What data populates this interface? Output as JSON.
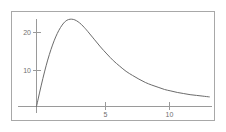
{
  "figure": {
    "background_color": "#ffffff",
    "frame_color": "#a8a8a8",
    "axis_color": "#9a9a9a",
    "curve_color": "#6b6b6b",
    "label_color": "#6f6f6f"
  },
  "chart_data": {
    "type": "line",
    "title": "",
    "xlabel": "",
    "ylabel": "",
    "xlim": [
      -0.4,
      13.6
    ],
    "ylim": [
      -1.2,
      26.5
    ],
    "grid": false,
    "legend": null,
    "x_ticks": [
      5,
      10
    ],
    "x_tick_labels": [
      "5",
      "10"
    ],
    "y_ticks": [
      10,
      20
    ],
    "y_tick_labels": [
      "10",
      "20"
    ],
    "series": [
      {
        "name": "density",
        "x": [
          0.0,
          0.25,
          0.5,
          0.75,
          1.0,
          1.25,
          1.5,
          1.75,
          2.0,
          2.25,
          2.5,
          2.75,
          3.0,
          3.25,
          3.5,
          3.75,
          4.0,
          4.5,
          5.0,
          5.5,
          6.0,
          6.5,
          7.0,
          7.5,
          8.0,
          8.5,
          9.0,
          9.5,
          10.0,
          10.5,
          11.0,
          11.5,
          12.0,
          12.5,
          13.0,
          13.5
        ],
        "y": [
          0.0,
          3.9,
          7.6,
          11.0,
          14.0,
          16.6,
          18.8,
          20.6,
          22.0,
          23.0,
          23.5,
          23.6,
          23.4,
          22.9,
          22.2,
          21.3,
          20.3,
          18.2,
          16.1,
          14.2,
          12.4,
          10.9,
          9.5,
          8.4,
          7.4,
          6.5,
          5.8,
          5.2,
          4.6,
          4.2,
          3.8,
          3.5,
          3.2,
          3.0,
          2.8,
          2.6
        ]
      }
    ],
    "peak": {
      "x": 2.8,
      "y": 23.6
    }
  },
  "labels": {
    "y20": "20",
    "y10": "10",
    "x5": "5",
    "x10": "10"
  }
}
